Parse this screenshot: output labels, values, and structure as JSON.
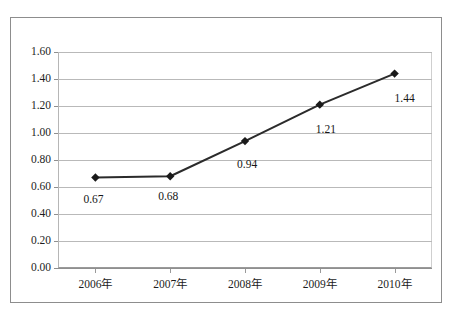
{
  "figure": {
    "title_remnant": "·· ····· ·· ·····",
    "frame": {
      "border_color": "#8d8d8d",
      "background": "#ffffff"
    }
  },
  "chart_data": {
    "type": "line",
    "title": "",
    "xlabel": "",
    "ylabel": "",
    "categories": [
      "2006年",
      "2007年",
      "2008年",
      "2009年",
      "2010年"
    ],
    "values": [
      0.67,
      0.68,
      0.94,
      1.21,
      1.44
    ],
    "point_labels": [
      "0.67",
      "0.68",
      "0.94",
      "1.21",
      "1.44"
    ],
    "ylim": [
      0.0,
      1.6
    ],
    "ytick_values": [
      0.0,
      0.2,
      0.4,
      0.6,
      0.8,
      1.0,
      1.2,
      1.4,
      1.6
    ],
    "ytick_labels": [
      "0.00",
      "0.20",
      "0.40",
      "0.60",
      "0.80",
      "1.00",
      "1.20",
      "1.40",
      "1.60"
    ],
    "grid": {
      "horizontal": true,
      "vertical": false
    },
    "legend": {
      "visible": false,
      "position": "none"
    },
    "series": [
      {
        "name": "",
        "values": [
          0.67,
          0.68,
          0.94,
          1.21,
          1.44
        ],
        "line_color": "#2b2b2b",
        "marker": "diamond",
        "marker_color": "#1a1a1a"
      }
    ],
    "colors": {
      "line": "#2b2b2b",
      "marker": "#1a1a1a",
      "grid": "#b9b9b9",
      "axis": "#8f8f8f",
      "text": "#1d1d1d",
      "frame": "#8d8d8d",
      "background": "#ffffff"
    }
  }
}
